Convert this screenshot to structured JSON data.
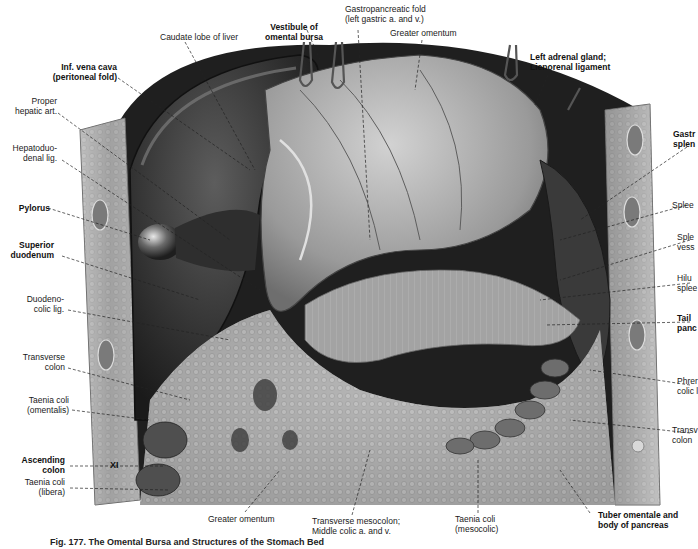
{
  "figure": {
    "caption": "Fig. 177. The Omental Bursa and Structures of the Stomach Bed",
    "rib_marker": "XI",
    "colors": {
      "background": "#ffffff",
      "liver_dark": "#2b2b2b",
      "liver_mid": "#4a4a4a",
      "tissue_light": "#b9b9b9",
      "tissue_mid": "#8e8e8e",
      "body_wall": "#a8a8a8",
      "label_text": "#1a1a1a",
      "leader_line": "#222222"
    }
  },
  "labels": {
    "top": [
      {
        "id": "caudate-lobe",
        "lines": [
          "Caudate lobe of liver"
        ],
        "bold": false
      },
      {
        "id": "vestibule-omental-bursa",
        "lines": [
          "Vestibule of",
          "omental bursa"
        ],
        "bold": true
      },
      {
        "id": "gastropancreatic-fold",
        "lines": [
          "Gastropancreatic fold",
          "(left gastric a. and v.)"
        ],
        "bold": false
      },
      {
        "id": "greater-omentum-top",
        "lines": [
          "Greater omentum"
        ],
        "bold": false
      },
      {
        "id": "left-adrenal-gland",
        "lines": [
          "Left adrenal gland;",
          "Lienorenal ligament"
        ],
        "bold": true
      }
    ],
    "left": [
      {
        "id": "inf-vena-cava",
        "lines": [
          "Inf. vena cava",
          "(peritoneal fold)"
        ],
        "bold": true
      },
      {
        "id": "proper-hepatic-art",
        "lines": [
          "Proper",
          "hepatic art."
        ],
        "bold": false
      },
      {
        "id": "hepatoduodenal-lig",
        "lines": [
          "Hepatoduo-",
          "denal lig."
        ],
        "bold": false
      },
      {
        "id": "pylorus",
        "lines": [
          "Pylorus"
        ],
        "bold": true
      },
      {
        "id": "superior-duodenum",
        "lines": [
          "Superior",
          "duodenum"
        ],
        "bold": true
      },
      {
        "id": "duodenocolic-lig",
        "lines": [
          "Duodeno-",
          "colic lig."
        ],
        "bold": false
      },
      {
        "id": "transverse-colon-left",
        "lines": [
          "Transverse",
          "colon"
        ],
        "bold": false
      },
      {
        "id": "taenia-coli-omentalis",
        "lines": [
          "Taenia coli",
          "(omentalis)"
        ],
        "bold": false
      },
      {
        "id": "ascending-colon",
        "lines": [
          "Ascending",
          "colon"
        ],
        "bold": true
      },
      {
        "id": "taenia-coli-libera",
        "lines": [
          "Taenia coli",
          "(libera)"
        ],
        "bold": false
      }
    ],
    "right": [
      {
        "id": "gastrosplenic-lig",
        "lines": [
          "Gastr",
          "splen"
        ],
        "bold": true
      },
      {
        "id": "spleen",
        "lines": [
          "Splee"
        ],
        "bold": false
      },
      {
        "id": "splenic-vessels",
        "lines": [
          "Sple",
          "vess"
        ],
        "bold": false
      },
      {
        "id": "hilum-spleen",
        "lines": [
          "Hilu",
          "splee"
        ],
        "bold": false
      },
      {
        "id": "tail-pancreas",
        "lines": [
          "Tail",
          "panc"
        ],
        "bold": true
      },
      {
        "id": "phrenicocolic-lig",
        "lines": [
          "Phrer",
          "colic l"
        ],
        "bold": false
      },
      {
        "id": "transverse-colon-right",
        "lines": [
          "Transv",
          "colon"
        ],
        "bold": false
      }
    ],
    "bottom": [
      {
        "id": "greater-omentum-bottom",
        "lines": [
          "Greater omentum"
        ],
        "bold": false
      },
      {
        "id": "transverse-mesocolon",
        "lines": [
          "Transverse mesocolon;",
          "Middle colic a. and v."
        ],
        "bold": false
      },
      {
        "id": "taenia-coli-mesocolic",
        "lines": [
          "Taenia coli",
          "(mesocolic)"
        ],
        "bold": false
      },
      {
        "id": "tuber-omentale",
        "lines": [
          "Tuber omentale and",
          "body of pancreas"
        ],
        "bold": true
      }
    ]
  }
}
